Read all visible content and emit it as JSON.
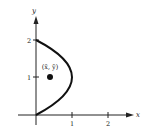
{
  "figure": {
    "type": "region-with-centroid",
    "axes": {
      "x_label": "x",
      "y_label": "y",
      "x_ticks": [
        "1",
        "2"
      ],
      "y_ticks": [
        "1",
        "2"
      ]
    },
    "curve": "x = 2y - y^2",
    "vertex": [
      1,
      1
    ],
    "centroid_label": "(x̄, ȳ)",
    "centroid": [
      0.4,
      1
    ],
    "colors": {
      "stroke": "#111111",
      "background": "#ffffff"
    }
  }
}
